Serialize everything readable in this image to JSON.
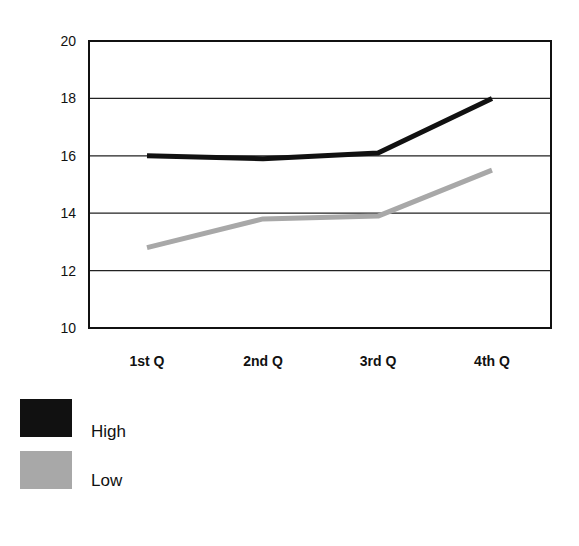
{
  "chart_data": {
    "type": "line",
    "title": "",
    "xlabel": "",
    "ylabel": "",
    "categories": [
      "1st Q",
      "2nd Q",
      "3rd Q",
      "4th Q"
    ],
    "ylim": [
      10,
      20
    ],
    "yticks": [
      10,
      12,
      14,
      16,
      18,
      20
    ],
    "grid": true,
    "legend_position": "bottom-left",
    "series": [
      {
        "name": "High",
        "color": "#111111",
        "values": [
          16.0,
          15.9,
          16.1,
          18.0
        ]
      },
      {
        "name": "Low",
        "color": "#a8a8a8",
        "values": [
          12.8,
          13.8,
          13.9,
          15.5
        ]
      }
    ]
  },
  "legend": {
    "items": [
      {
        "label": "High",
        "color": "#111111"
      },
      {
        "label": "Low",
        "color": "#a8a8a8"
      }
    ]
  }
}
